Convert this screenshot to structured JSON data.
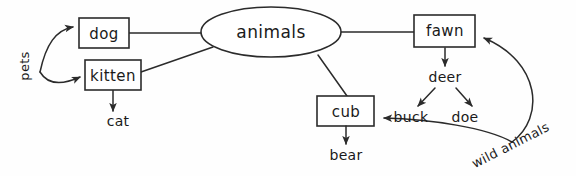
{
  "diagram": {
    "background_color": "#fefefe",
    "stroke_color": "#2b2b2b",
    "text_color": "#1a1a1a",
    "root": {
      "label": "animals",
      "shape": "ellipse"
    },
    "boxes": [
      {
        "id": "dog",
        "label": "dog"
      },
      {
        "id": "kitten",
        "label": "kitten"
      },
      {
        "id": "fawn",
        "label": "fawn"
      },
      {
        "id": "cub",
        "label": "cub"
      }
    ],
    "leaves": [
      {
        "id": "cat",
        "label": "cat"
      },
      {
        "id": "bear",
        "label": "bear"
      },
      {
        "id": "deer",
        "label": "deer"
      },
      {
        "id": "buck",
        "label": "buck"
      },
      {
        "id": "doe",
        "label": "doe"
      }
    ],
    "edge_labels": [
      {
        "id": "pets",
        "label": "pets",
        "rotation": -90
      },
      {
        "id": "wild-animals",
        "label": "wild animals",
        "rotation": -27
      }
    ],
    "edges": [
      {
        "from": "pets",
        "to": "dog",
        "arrow": true
      },
      {
        "from": "pets",
        "to": "kitten",
        "arrow": true
      },
      {
        "from": "dog",
        "to": "animals",
        "arrow": false
      },
      {
        "from": "kitten",
        "to": "animals",
        "arrow": false
      },
      {
        "from": "kitten",
        "to": "cat",
        "arrow": true
      },
      {
        "from": "animals",
        "to": "fawn",
        "arrow": false
      },
      {
        "from": "animals",
        "to": "cub",
        "arrow": false
      },
      {
        "from": "fawn",
        "to": "deer",
        "arrow": true
      },
      {
        "from": "deer",
        "to": "buck",
        "arrow": true
      },
      {
        "from": "deer",
        "to": "doe",
        "arrow": true
      },
      {
        "from": "wild-animals",
        "to": "fawn",
        "arrow": true
      },
      {
        "from": "wild-animals",
        "to": "cub",
        "arrow": true
      }
    ]
  }
}
